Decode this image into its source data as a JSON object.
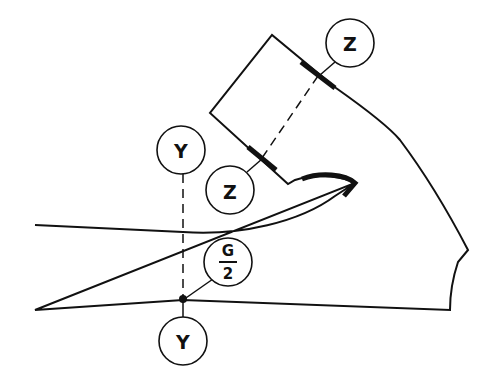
{
  "diagram": {
    "labels": {
      "z_top": "Z",
      "z_bottom": "Z",
      "y_top": "Y",
      "y_bottom": "Y",
      "g_numerator": "G",
      "g_denominator": "2"
    },
    "colors": {
      "stroke": "#111111",
      "background": "#ffffff"
    }
  }
}
